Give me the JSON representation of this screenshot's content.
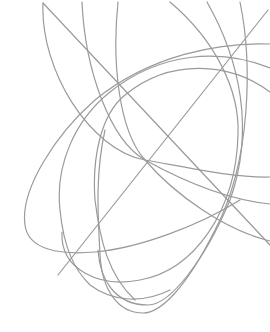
{
  "artwork": {
    "description": "Abstract line art of intersecting gray elliptical arcs and two straight lines on white",
    "background_color": "#ffffff",
    "line_color": "#9a9a9a",
    "width": 270,
    "height": 332
  }
}
